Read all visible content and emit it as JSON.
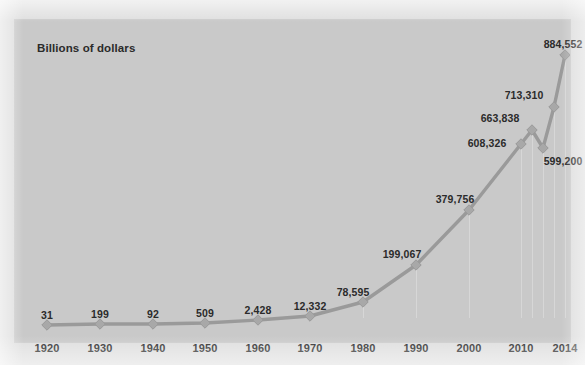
{
  "chart_data": {
    "type": "line",
    "title": "Billions of dollars",
    "xlabel": "",
    "ylabel": "Billions of dollars",
    "grid": "vertical-faint",
    "legend": "none",
    "x": [
      1920,
      1930,
      1940,
      1950,
      1960,
      1970,
      1980,
      1990,
      2000,
      2010,
      2011,
      2012,
      2013,
      2014
    ],
    "tick_labels": [
      "1920",
      "1930",
      "1940",
      "1950",
      "1960",
      "1970",
      "1980",
      "1990",
      "2000",
      "2010",
      "2014"
    ],
    "values": [
      31,
      199,
      92,
      509,
      2428,
      12332,
      78595,
      199067,
      379756,
      608326,
      663838,
      599200,
      713310,
      884552
    ],
    "point_labels": [
      "31",
      "199",
      "92",
      "509",
      "2,428",
      "12,332",
      "78,595",
      "199,067",
      "379,756",
      "608,326",
      "663,838",
      "599,200",
      "713,310",
      "884,552"
    ],
    "ylim": [
      0,
      884552
    ],
    "colors": {
      "panel_background": "#c9c9c9",
      "page_background": "#dedede",
      "series_line": "#9a9a9a",
      "marker_fill": "#a8a8a8",
      "label_text": "#2b2b2b",
      "gridline": "#e1e1e1"
    },
    "points": [
      {
        "year": "1920",
        "label": "31",
        "px": 32,
        "py": 305,
        "lx": 32,
        "ly": 289,
        "tick": true
      },
      {
        "year": "1930",
        "label": "199",
        "px": 85,
        "py": 304,
        "lx": 85,
        "ly": 288,
        "tick": true
      },
      {
        "year": "1940",
        "label": "92",
        "px": 138,
        "py": 304,
        "lx": 138,
        "ly": 288,
        "tick": true
      },
      {
        "year": "1950",
        "label": "509",
        "px": 190,
        "py": 303,
        "lx": 190,
        "ly": 287,
        "tick": true
      },
      {
        "year": "1960",
        "label": "2,428",
        "px": 243,
        "py": 300,
        "lx": 243,
        "ly": 284,
        "tick": true
      },
      {
        "year": "1970",
        "label": "12,332",
        "px": 295,
        "py": 296,
        "lx": 295,
        "ly": 280,
        "tick": true
      },
      {
        "year": "1980",
        "label": "78,595",
        "px": 348,
        "py": 282,
        "lx": 338,
        "ly": 266,
        "tick": true
      },
      {
        "year": "1990",
        "label": "199,067",
        "px": 401,
        "py": 245,
        "lx": 387,
        "ly": 228,
        "tick": true
      },
      {
        "year": "2000",
        "label": "379,756",
        "px": 454,
        "py": 190,
        "lx": 440,
        "ly": 173,
        "tick": true
      },
      {
        "year": "2010",
        "label": "608,326",
        "px": 506,
        "py": 124,
        "lx": 472,
        "ly": 117,
        "tick": true
      },
      {
        "year": "2011",
        "label": "663,838",
        "px": 517,
        "py": 110,
        "lx": 485,
        "ly": 92,
        "tick": false
      },
      {
        "year": "2012",
        "label": "599,200",
        "px": 528,
        "py": 128,
        "lx": 548,
        "ly": 135,
        "tick": false
      },
      {
        "year": "2013",
        "label": "713,310",
        "px": 539,
        "py": 87,
        "lx": 509,
        "ly": 69,
        "tick": false
      },
      {
        "year": "2014",
        "label": "884,552",
        "px": 550,
        "py": 35,
        "lx": 548,
        "ly": 18,
        "tick": true
      }
    ],
    "gridlines_px": [
      348,
      401,
      454,
      506,
      517,
      528,
      539,
      550
    ],
    "x_axis_ticks": [
      {
        "label": "1920",
        "px": 32
      },
      {
        "label": "1930",
        "px": 85
      },
      {
        "label": "1940",
        "px": 138
      },
      {
        "label": "1950",
        "px": 190
      },
      {
        "label": "1960",
        "px": 243
      },
      {
        "label": "1970",
        "px": 295
      },
      {
        "label": "1980",
        "px": 348
      },
      {
        "label": "1990",
        "px": 401
      },
      {
        "label": "2000",
        "px": 454
      },
      {
        "label": "2010",
        "px": 506
      },
      {
        "label": "2014",
        "px": 550
      }
    ]
  }
}
